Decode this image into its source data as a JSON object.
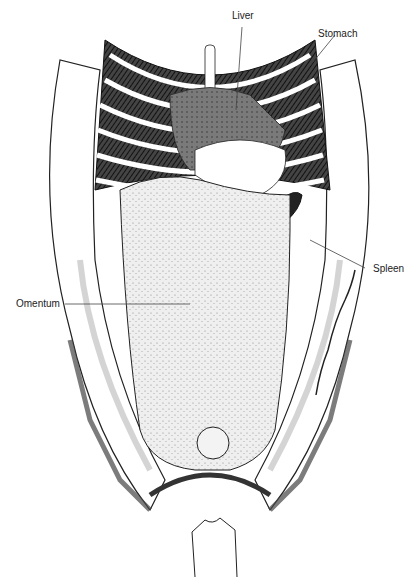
{
  "figure": {
    "colors": {
      "ink": "#1a1a1a",
      "line": "#333333",
      "shade": "#d9d9d9",
      "background": "#ffffff"
    }
  },
  "labels": [
    {
      "id": "liver",
      "text": "Liver"
    },
    {
      "id": "stomach",
      "text": "Stomach"
    },
    {
      "id": "spleen",
      "text": "Spleen"
    },
    {
      "id": "omentum",
      "text": "Omentum"
    }
  ],
  "artist_signature": {
    "present": true,
    "legible": false
  }
}
